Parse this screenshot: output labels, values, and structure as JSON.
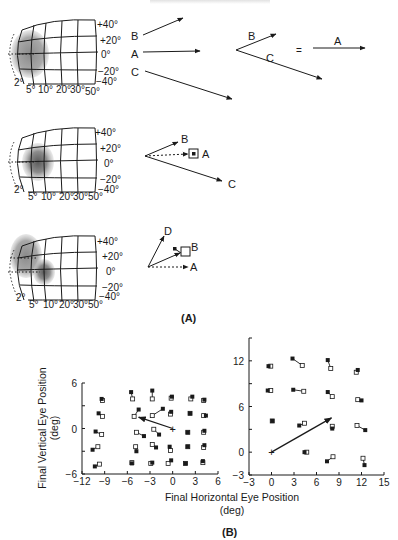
{
  "header": {
    "text_cutoff": ""
  },
  "panel_a": {
    "label": "(A)",
    "retina_map": {
      "elevation_labels": [
        "+40°",
        "+20°",
        "0°",
        "−20°",
        "−40°"
      ],
      "eccentricity_labels": [
        "2°",
        "5°",
        "10°",
        "20°",
        "30°",
        "50°"
      ]
    },
    "row1": {
      "vectors_left": [
        "B",
        "A",
        "C"
      ],
      "vectors_sum": [
        "B",
        "C"
      ],
      "equals": "=",
      "result": "A"
    },
    "row2": {
      "vectors": [
        "B",
        "A",
        "C"
      ]
    },
    "row3": {
      "vectors": [
        "D",
        "B",
        "A"
      ]
    }
  },
  "panel_b": {
    "label": "(B)"
  },
  "chart_data": [
    {
      "type": "scatter",
      "title": "",
      "xlabel": "Final Horizontal Eye Position (deg)",
      "ylabel": "Final Vertical Eye Position (deg)",
      "xlim": [
        -12,
        6
      ],
      "ylim": [
        -6,
        6
      ],
      "xticks": [
        -12,
        -9,
        -6,
        -3,
        0,
        3,
        6
      ],
      "yticks": [
        -6,
        0,
        6
      ],
      "grid": false,
      "legend": "filled square = saccade endpoint; open square = paired endpoint (connected by line)",
      "stimulation_vector": {
        "from": [
          0,
          0
        ],
        "to": [
          -4.5,
          1.5
        ]
      },
      "pairs": [
        {
          "filled": [
            -9.4,
            3.9
          ],
          "open": [
            -9.3,
            3.7
          ]
        },
        {
          "filled": [
            -9.8,
            2.0
          ],
          "open": [
            -9.3,
            1.6
          ]
        },
        {
          "filled": [
            -10.2,
            -0.4
          ],
          "open": [
            -9.4,
            -0.8
          ]
        },
        {
          "filled": [
            -10.6,
            -2.8
          ],
          "open": [
            -9.9,
            -2.4
          ]
        },
        {
          "filled": [
            -10.3,
            -5.0
          ],
          "open": [
            -9.7,
            -4.7
          ]
        },
        {
          "filled": [
            -5.5,
            4.8
          ],
          "open": [
            -5.3,
            3.9
          ]
        },
        {
          "filled": [
            -2.7,
            5.0
          ],
          "open": [
            -2.7,
            3.9
          ]
        },
        {
          "filled": [
            -0.1,
            4.2
          ],
          "open": [
            -0.2,
            4.0
          ]
        },
        {
          "filled": [
            2.6,
            4.2
          ],
          "open": [
            2.4,
            3.9
          ]
        },
        {
          "filled": [
            4.2,
            3.8
          ],
          "open": [
            4.1,
            3.7
          ]
        },
        {
          "filled": [
            -4.5,
            2.5
          ],
          "open": [
            -5.1,
            1.6
          ]
        },
        {
          "filled": [
            -1.3,
            2.6
          ],
          "open": [
            -2.7,
            1.7
          ]
        },
        {
          "filled": [
            -0.2,
            2.2
          ],
          "open": [
            -0.3,
            1.9
          ]
        },
        {
          "filled": [
            2.3,
            2.0
          ],
          "open": [
            2.3,
            2.0
          ]
        },
        {
          "filled": [
            4.4,
            1.7
          ],
          "open": [
            4.1,
            1.7
          ]
        },
        {
          "filled": [
            -3.8,
            -1.0
          ],
          "open": [
            -4.8,
            -0.5
          ]
        },
        {
          "filled": [
            -1.8,
            -0.8
          ],
          "open": [
            -2.5,
            -0.1
          ]
        },
        {
          "filled": [
            2.0,
            -0.5
          ],
          "open": [
            2.0,
            -0.5
          ]
        },
        {
          "filled": [
            4.2,
            -0.3
          ],
          "open": [
            4.1,
            -0.5
          ]
        },
        {
          "filled": [
            -4.8,
            -3.0
          ],
          "open": [
            -4.9,
            -2.4
          ]
        },
        {
          "filled": [
            -2.2,
            -2.5
          ],
          "open": [
            -2.7,
            -2.1
          ]
        },
        {
          "filled": [
            -0.4,
            -2.4
          ],
          "open": [
            -0.3,
            -2.9
          ]
        },
        {
          "filled": [
            2.0,
            -2.4
          ],
          "open": [
            2.0,
            -2.4
          ]
        },
        {
          "filled": [
            4.2,
            -2.2
          ],
          "open": [
            4.1,
            -2.5
          ]
        },
        {
          "filled": [
            -5.4,
            -4.6
          ],
          "open": [
            -5.4,
            -4.5
          ]
        },
        {
          "filled": [
            -2.7,
            -4.5
          ],
          "open": [
            -2.9,
            -4.6
          ]
        },
        {
          "filled": [
            -0.2,
            -4.2
          ],
          "open": [
            -0.6,
            -4.6
          ]
        },
        {
          "filled": [
            1.7,
            -4.6
          ],
          "open": [
            1.7,
            -4.6
          ]
        },
        {
          "filled": [
            4.0,
            -4.3
          ],
          "open": [
            4.0,
            -4.5
          ]
        }
      ]
    },
    {
      "type": "scatter",
      "title": "",
      "xlabel": "Final Horizontal Eye Position (deg)",
      "ylabel": "",
      "xlim": [
        -3,
        15
      ],
      "ylim": [
        -3,
        15
      ],
      "xticks": [
        -3,
        0,
        3,
        6,
        9,
        12,
        15
      ],
      "yticks": [
        -3,
        0,
        6,
        12
      ],
      "grid": false,
      "stimulation_vector": {
        "from": [
          0,
          0
        ],
        "to": [
          8,
          4.5
        ]
      },
      "pairs": [
        {
          "filled": [
            -0.4,
            11.3
          ],
          "open": [
            -0.1,
            11.3
          ]
        },
        {
          "filled": [
            2.8,
            12.3
          ],
          "open": [
            4.1,
            11.4
          ]
        },
        {
          "filled": [
            7.5,
            12.1
          ],
          "open": [
            7.9,
            11.0
          ]
        },
        {
          "filled": [
            11.5,
            10.8
          ],
          "open": [
            11.3,
            10.5
          ]
        },
        {
          "filled": [
            -0.5,
            8.1
          ],
          "open": [
            -0.1,
            8.1
          ]
        },
        {
          "filled": [
            2.9,
            8.2
          ],
          "open": [
            4.3,
            8.0
          ]
        },
        {
          "filled": [
            7.5,
            7.9
          ],
          "open": [
            8.1,
            7.3
          ]
        },
        {
          "filled": [
            12.0,
            6.8
          ],
          "open": [
            11.5,
            6.9
          ]
        },
        {
          "filled": [
            0.1,
            4.1
          ],
          "open": [
            0.1,
            4.1
          ]
        },
        {
          "filled": [
            3.7,
            3.5
          ],
          "open": [
            4.4,
            3.8
          ]
        },
        {
          "filled": [
            8.1,
            3.1
          ],
          "open": [
            8.1,
            3.4
          ]
        },
        {
          "filled": [
            12.5,
            2.9
          ],
          "open": [
            11.4,
            3.5
          ]
        },
        {
          "filled": [
            4.4,
            0.0
          ],
          "open": [
            4.7,
            0.0
          ]
        },
        {
          "filled": [
            7.4,
            -1.2
          ],
          "open": [
            8.2,
            -0.6
          ]
        },
        {
          "filled": [
            12.4,
            -1.7
          ],
          "open": [
            12.2,
            -0.8
          ]
        }
      ]
    }
  ]
}
